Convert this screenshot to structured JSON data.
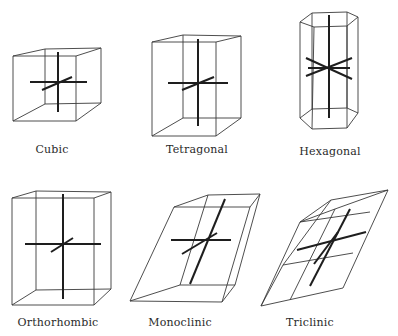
{
  "figure": {
    "colors": {
      "background": "#ffffff",
      "edge": "#3a3a3a",
      "axis": "#1e1e1e",
      "label": "#2a2a2a"
    },
    "systems": [
      {
        "id": "cubic",
        "label": "Cubic",
        "label_pos": {
          "x": 52,
          "y": 146
        },
        "front": [
          [
            13,
            56
          ],
          [
            76,
            56
          ],
          [
            76,
            121
          ],
          [
            13,
            121
          ]
        ],
        "back": [
          [
            45,
            49
          ],
          [
            101,
            48
          ],
          [
            101,
            103
          ],
          [
            45,
            104
          ]
        ],
        "axes": [
          [
            [
              58,
              52
            ],
            [
              58,
              112
            ]
          ],
          [
            [
              30,
              82
            ],
            [
              87,
              82
            ]
          ],
          [
            [
              42,
              90
            ],
            [
              72,
              77
            ]
          ]
        ]
      },
      {
        "id": "tetragonal",
        "label": "Tetragonal",
        "label_pos": {
          "x": 197,
          "y": 146
        },
        "front": [
          [
            152,
            42
          ],
          [
            216,
            42
          ],
          [
            216,
            136
          ],
          [
            152,
            136
          ]
        ],
        "back": [
          [
            183,
            35
          ],
          [
            241,
            36
          ],
          [
            241,
            118
          ],
          [
            183,
            118
          ]
        ],
        "axes": [
          [
            [
              198,
              39
            ],
            [
              198,
              126
            ]
          ],
          [
            [
              168,
              83
            ],
            [
              228,
              83
            ]
          ],
          [
            [
              182,
              90
            ],
            [
              214,
              77
            ]
          ]
        ]
      },
      {
        "id": "hexagonal",
        "label": "Hexagonal",
        "label_pos": {
          "x": 330,
          "y": 148
        },
        "top_hex": [
          [
            300,
            22
          ],
          [
            312,
            13
          ],
          [
            347,
            12
          ],
          [
            358,
            17
          ],
          [
            347,
            26
          ],
          [
            314,
            27
          ]
        ],
        "bottom_hex": [
          [
            300,
            118
          ],
          [
            312,
            109
          ],
          [
            347,
            108
          ],
          [
            358,
            113
          ],
          [
            347,
            128
          ],
          [
            312,
            129
          ]
        ],
        "axes": [
          [
            [
              329,
              15
            ],
            [
              329,
              118
            ]
          ],
          [
            [
              306,
              58
            ],
            [
              352,
              79
            ]
          ],
          [
            [
              306,
              76
            ],
            [
              352,
              58
            ]
          ],
          [
            [
              308,
              68
            ],
            [
              350,
              68
            ]
          ]
        ]
      },
      {
        "id": "orthorhombic",
        "label": "Orthorhombic",
        "label_pos": {
          "x": 58,
          "y": 320
        },
        "front": [
          [
            12,
            198
          ],
          [
            94,
            198
          ],
          [
            94,
            305
          ],
          [
            12,
            305
          ]
        ],
        "back": [
          [
            36,
            191
          ],
          [
            111,
            192
          ],
          [
            111,
            289
          ],
          [
            36,
            290
          ]
        ],
        "axes": [
          [
            [
              63,
              194
            ],
            [
              63,
              299
            ]
          ],
          [
            [
              25,
              244
            ],
            [
              101,
              244
            ]
          ],
          [
            [
              51,
              252
            ],
            [
              73,
              238
            ]
          ]
        ]
      },
      {
        "id": "monoclinic",
        "label": "Monoclinic",
        "label_pos": {
          "x": 180,
          "y": 320
        },
        "front": [
          [
            174,
            207
          ],
          [
            250,
            207
          ],
          [
            222,
            302
          ],
          [
            130,
            301
          ]
        ],
        "back": [
          [
            208,
            195
          ],
          [
            260,
            194
          ],
          [
            235,
            285
          ],
          [
            180,
            285
          ]
        ],
        "axes": [
          [
            [
              225,
              199
            ],
            [
              190,
              284
            ]
          ],
          [
            [
              171,
              240
            ],
            [
              231,
              240
            ]
          ],
          [
            [
              182,
              254
            ],
            [
              217,
              233
            ]
          ]
        ]
      },
      {
        "id": "triclinic",
        "label": "Triclinic",
        "label_pos": {
          "x": 310,
          "y": 320
        },
        "front": [
          [
            299,
            221
          ],
          [
            331,
            200
          ],
          [
            388,
            190
          ],
          [
            343,
            288
          ],
          [
            261,
            306
          ]
        ],
        "back": [
          [
            331,
            200
          ],
          [
            389,
            185
          ],
          [
            338,
            281
          ],
          [
            278,
            267
          ]
        ],
        "axes": [
          [
            [
              350,
              209
            ],
            [
              310,
              286
            ]
          ],
          [
            [
              297,
              250
            ],
            [
              366,
              232
            ]
          ],
          [
            [
              314,
              264
            ],
            [
              338,
              232
            ]
          ]
        ]
      }
    ]
  }
}
